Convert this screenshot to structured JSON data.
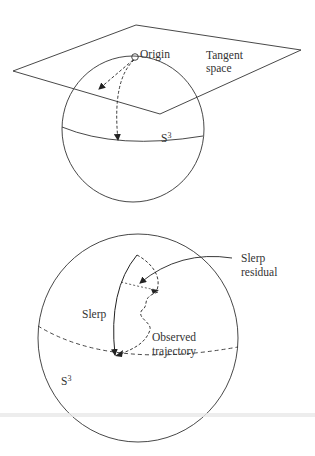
{
  "panel_top": {
    "labels": {
      "origin": "Origin",
      "tangent_line1": "Tangent",
      "tangent_line2": "space",
      "sphere_base": "S",
      "sphere_exp": "3"
    }
  },
  "panel_bottom": {
    "labels": {
      "slerp": "Slerp",
      "residual_line1": "Slerp",
      "residual_line2": "residual",
      "observed_line1": "Observed",
      "observed_line2": "trajectory",
      "sphere_base": "S",
      "sphere_exp": "3"
    }
  },
  "colors": {
    "stroke": "#333333",
    "background": "#ffffff"
  }
}
